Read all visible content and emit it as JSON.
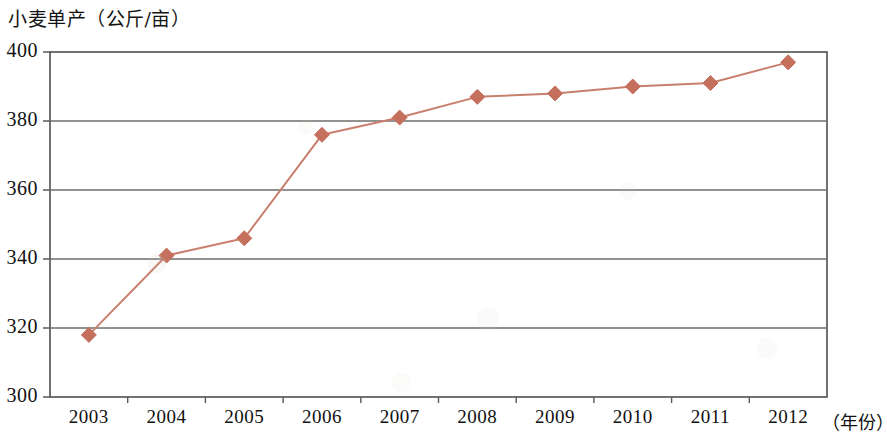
{
  "chart_data": {
    "type": "line",
    "title": "小麦单产（公斤/亩）",
    "xlabel": "（年份）",
    "ylabel": "",
    "categories": [
      "2003",
      "2004",
      "2005",
      "2006",
      "2007",
      "2008",
      "2009",
      "2010",
      "2011",
      "2012"
    ],
    "values": [
      318,
      341,
      346,
      376,
      381,
      387,
      388,
      390,
      391,
      397
    ],
    "series": [
      {
        "name": "小麦单产",
        "values": [
          318,
          341,
          346,
          376,
          381,
          387,
          388,
          390,
          391,
          397
        ]
      }
    ],
    "ylim": [
      300,
      400
    ],
    "yticks": [
      "300",
      "320",
      "340",
      "360",
      "380",
      "400"
    ],
    "ytick_values": [
      300,
      320,
      340,
      360,
      380,
      400
    ],
    "grid": "horizontal",
    "legend": "none",
    "marker": "diamond",
    "line_color": "#c87f6d",
    "marker_color": "#c4705d",
    "axis_color": "#5a5a58",
    "grid_color": "#6e6e6c"
  },
  "axis": {
    "x_unit_label": "（年份）"
  }
}
